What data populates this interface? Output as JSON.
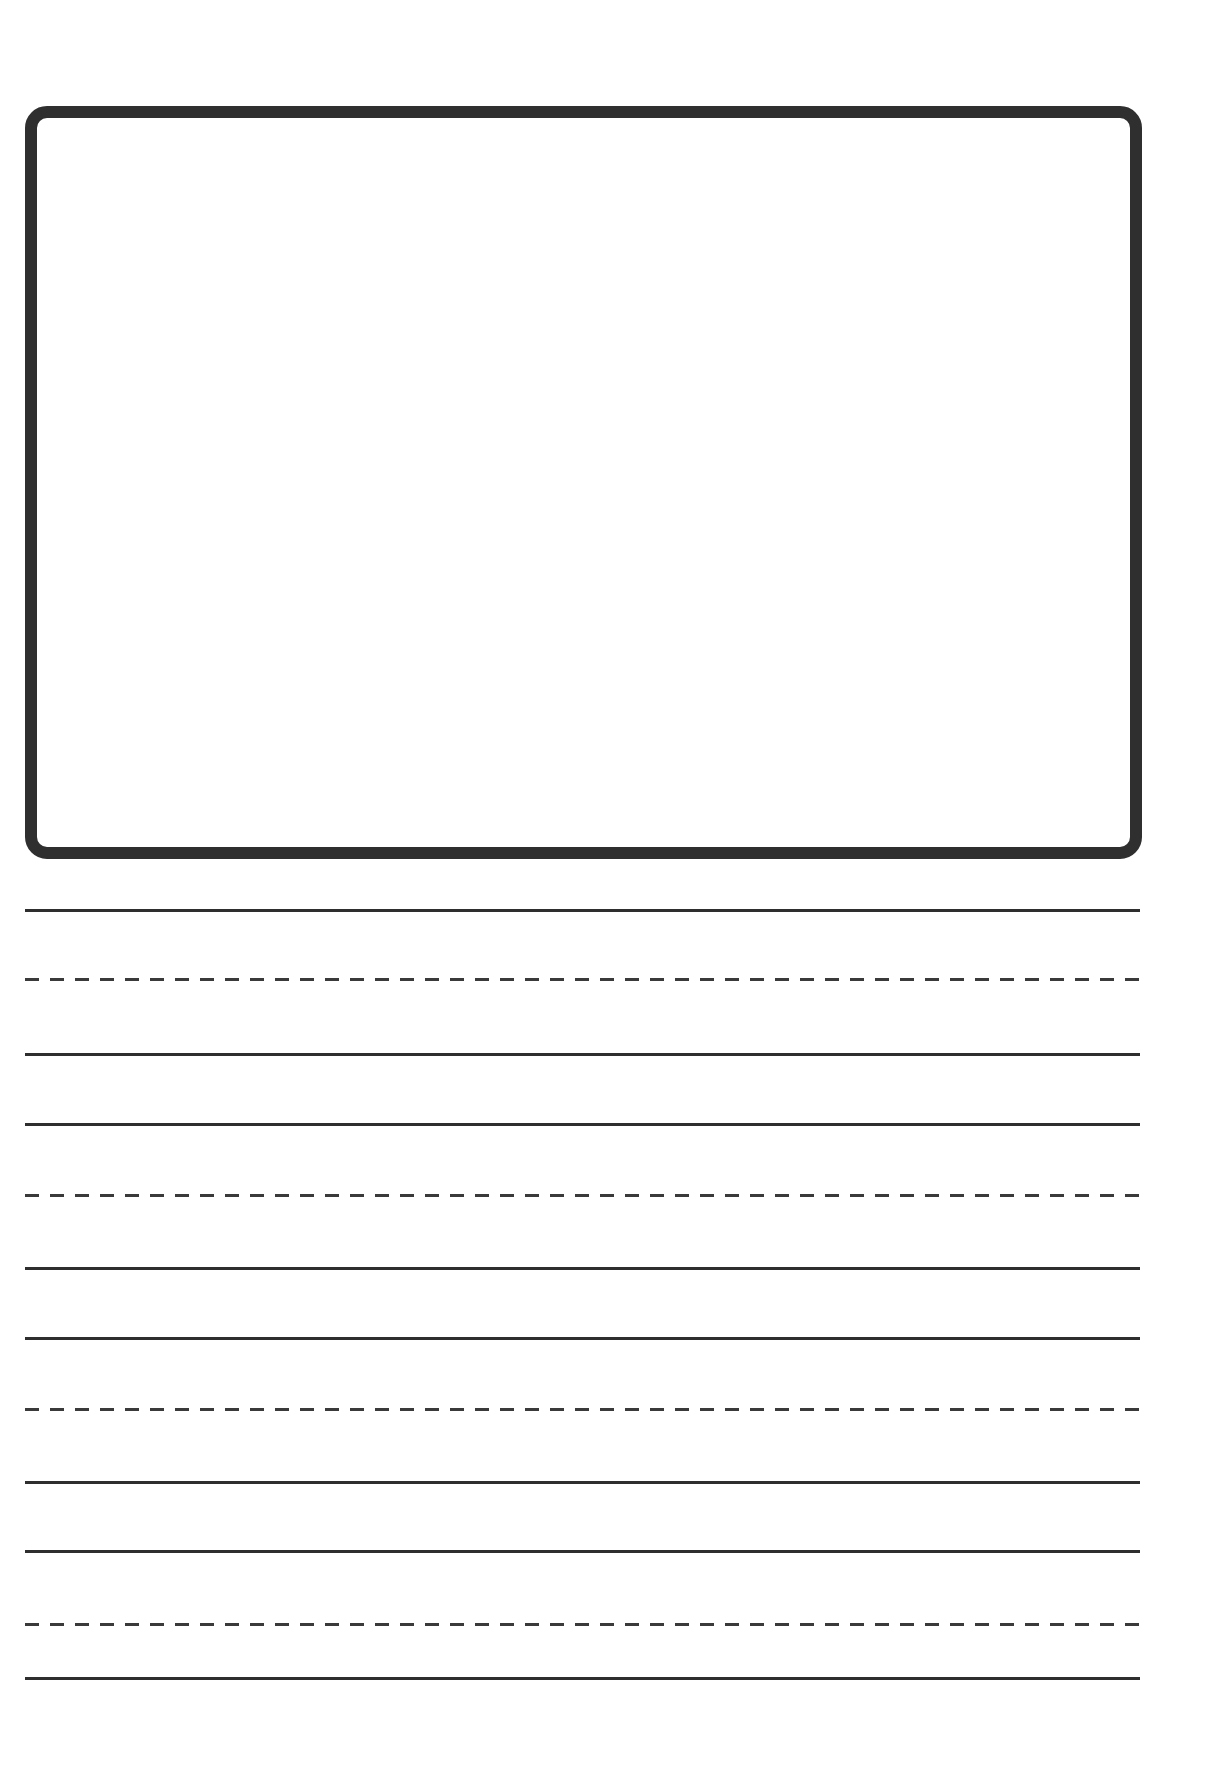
{
  "page": {
    "type": "primary writing paper",
    "background": "#ffffff",
    "ink_color": "#2e2e2e"
  },
  "drawing_box": {
    "label": ""
  },
  "writing_lines": [
    {
      "group": 1,
      "top": 910,
      "mid": 979,
      "base": 1054
    },
    {
      "group": 2,
      "top": 1124,
      "mid": 1195,
      "base": 1268
    },
    {
      "group": 3,
      "top": 1338,
      "mid": 1409,
      "base": 1482
    },
    {
      "group": 4,
      "top": 1551,
      "mid": 1624,
      "base": 1678
    }
  ]
}
